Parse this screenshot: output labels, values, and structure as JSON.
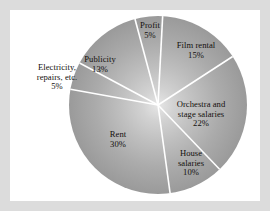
{
  "figure": {
    "background_color": "#dcdcdc",
    "panel_color": "#ffffff",
    "separator_color": "#ffffff"
  },
  "chart_data": {
    "type": "pie",
    "title": "",
    "subtitle": "",
    "xlabel": "",
    "ylabel": "",
    "legend_position": "none",
    "grid": false,
    "units": "percent",
    "total": 100,
    "start_angle_deg": 3,
    "direction": "clockwise",
    "categories": [
      "Film rental",
      "Orchestra and stage salaries",
      "House salaries",
      "Rent",
      "Electricity, repairs, etc.",
      "Publicity",
      "Profit"
    ],
    "values": [
      15,
      22,
      10,
      30,
      5,
      13,
      5
    ],
    "slices": [
      {
        "name": "Film rental",
        "value": 15,
        "value_label": "15%",
        "label_lines": [
          "Film rental"
        ],
        "start_deg": 3,
        "end_deg": 57
      },
      {
        "name": "Orchestra and stage salaries",
        "value": 22,
        "value_label": "22%",
        "label_lines": [
          "Orchestra and",
          "stage salaries"
        ],
        "start_deg": 57,
        "end_deg": 136.2
      },
      {
        "name": "House salaries",
        "value": 10,
        "value_label": "10%",
        "label_lines": [
          "House",
          "salaries"
        ],
        "start_deg": 136.2,
        "end_deg": 172.2
      },
      {
        "name": "Rent",
        "value": 30,
        "value_label": "30%",
        "label_lines": [
          "Rent"
        ],
        "start_deg": 172.2,
        "end_deg": 280.2
      },
      {
        "name": "Electricity, repairs, etc.",
        "value": 5,
        "value_label": "5%",
        "label_lines": [
          "Electricity,",
          "repairs, etc."
        ],
        "start_deg": 280.2,
        "end_deg": 298.2
      },
      {
        "name": "Publicity",
        "value": 13,
        "value_label": "13%",
        "label_lines": [
          "Publicity"
        ],
        "start_deg": 298.2,
        "end_deg": 345
      },
      {
        "name": "Profit",
        "value": 5,
        "value_label": "5%",
        "label_lines": [
          "Profit"
        ],
        "start_deg": 345,
        "end_deg": 363
      }
    ]
  },
  "labels": {
    "profit": {
      "name": "Profit",
      "value": "5%"
    },
    "film_rental": {
      "name": "Film rental",
      "value": "15%"
    },
    "orchestra": {
      "line1": "Orchestra and",
      "line2": "stage salaries",
      "value": "22%"
    },
    "house_salaries": {
      "line1": "House",
      "line2": "salaries",
      "value": "10%"
    },
    "rent": {
      "name": "Rent",
      "value": "30%"
    },
    "electricity": {
      "line1": "Electricity,",
      "line2": "repairs, etc.",
      "value": "5%"
    },
    "publicity": {
      "name": "Publicity",
      "value": "13%"
    }
  }
}
